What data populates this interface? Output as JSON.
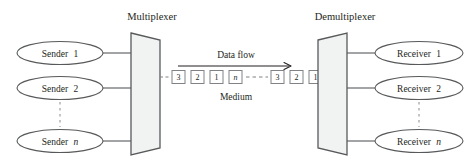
{
  "diagram": {
    "title_multiplexer": "Multiplexer",
    "title_demultiplexer": "Demultiplexer",
    "data_flow_label": "Data flow",
    "medium_label": "Medium",
    "senders": [
      {
        "prefix": "Sender",
        "suffix": "1",
        "italic_suffix": false
      },
      {
        "prefix": "Sender",
        "suffix": "2",
        "italic_suffix": false
      },
      {
        "prefix": "Sender",
        "suffix": "n",
        "italic_suffix": true
      }
    ],
    "receivers": [
      {
        "prefix": "Receiver",
        "suffix": "1",
        "italic_suffix": false
      },
      {
        "prefix": "Receiver",
        "suffix": "2",
        "italic_suffix": false
      },
      {
        "prefix": "Receiver",
        "suffix": "n",
        "italic_suffix": true
      }
    ],
    "left_cells": [
      {
        "label": "3",
        "italic": false
      },
      {
        "label": "2",
        "italic": false
      },
      {
        "label": "1",
        "italic": false
      },
      {
        "label": "n",
        "italic": true
      }
    ],
    "right_cells": [
      {
        "label": "3",
        "italic": false
      },
      {
        "label": "2",
        "italic": false
      },
      {
        "label": "1",
        "italic": false
      }
    ],
    "colors": {
      "stroke": "#58595b",
      "text": "#231f20",
      "box_fill": "#f1f2f2",
      "cell_stroke": "#808285",
      "dash": "#939598"
    }
  }
}
